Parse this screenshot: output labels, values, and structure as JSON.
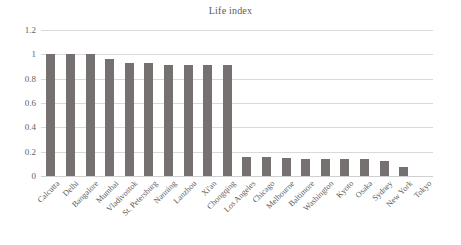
{
  "chart_data": {
    "type": "bar",
    "title": "Life index",
    "xlabel": "",
    "ylabel": "",
    "ylim": [
      0,
      1.2
    ],
    "ytick_labels": [
      "0",
      "0.2",
      "0.4",
      "0.6",
      "0.8",
      "1",
      "1.2"
    ],
    "ytick_values": [
      0,
      0.2,
      0.4,
      0.6,
      0.8,
      1,
      1.2
    ],
    "grid": true,
    "legend": "none",
    "bar_color": "#767171",
    "gridline_color": "#d9d9d9",
    "categories": [
      "Calcutta",
      "Delhi",
      "Bangalore",
      "Mumbai",
      "Vladivostok",
      "St. Petersburg",
      "Nanning",
      "Lanzhou",
      "Xi'an",
      "Chongqing",
      "Los Angeles",
      "Chicago",
      "Melbourne",
      "Baltimore",
      "Washington",
      "Kyoto",
      "Osaka",
      "Sydney",
      "New York",
      "Tokyo"
    ],
    "values": [
      1.0,
      1.0,
      1.0,
      0.96,
      0.93,
      0.93,
      0.91,
      0.91,
      0.91,
      0.91,
      0.16,
      0.155,
      0.145,
      0.14,
      0.14,
      0.14,
      0.14,
      0.12,
      0.07,
      0.0
    ]
  }
}
